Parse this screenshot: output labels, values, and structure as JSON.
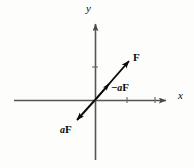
{
  "figure": {
    "background_color": "#fdfdfc",
    "axis_color": "#555555",
    "vector_color": "#0a0a0a",
    "label_color": "#0a0a0a"
  },
  "axes": {
    "x": {
      "label": "x",
      "line": {
        "x1": 14,
        "y1": 100,
        "x2": 168,
        "y2": 100
      },
      "arrow_tip": {
        "x": 172,
        "y": 100
      },
      "ticks": [
        {
          "x": 127,
          "y": 100
        },
        {
          "x": 155,
          "y": 100
        }
      ]
    },
    "y": {
      "label": "y",
      "line": {
        "x1": 95,
        "y1": 22,
        "x2": 95,
        "y2": 160
      },
      "arrow_tip": {
        "x": 95,
        "y": 18
      },
      "ticks": [
        {
          "x": 95,
          "y": 67
        }
      ]
    },
    "origin": {
      "x": 95,
      "y": 100
    }
  },
  "vectors": [
    {
      "name": "F",
      "label_sign": "",
      "label_scalar": "",
      "label_vector": "F",
      "from": {
        "x": 95,
        "y": 100
      },
      "to": {
        "x": 131,
        "y": 59
      },
      "label_position": {
        "x": 133,
        "y": 52
      }
    },
    {
      "name": "minus-a-F",
      "label_sign": "−",
      "label_scalar": "a",
      "label_vector": "F",
      "from": {
        "x": 95,
        "y": 100
      },
      "to": {
        "x": 111,
        "y": 81
      },
      "label_position": {
        "x": 111,
        "y": 82
      }
    },
    {
      "name": "a-F",
      "label_sign": "",
      "label_scalar": "a",
      "label_vector": "F",
      "from": {
        "x": 95,
        "y": 100
      },
      "to": {
        "x": 74,
        "y": 123
      },
      "label_position": {
        "x": 60,
        "y": 124
      }
    }
  ]
}
